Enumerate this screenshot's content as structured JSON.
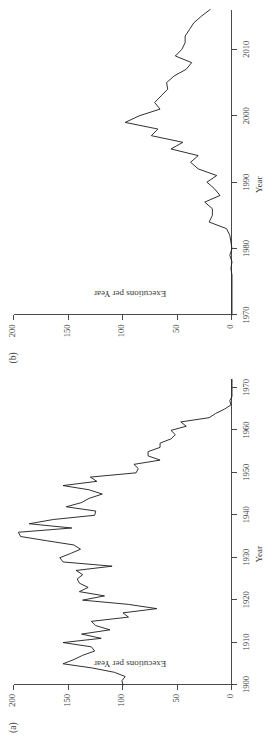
{
  "figure": {
    "orientation": "rotated-90-ccw",
    "background": "#ffffff",
    "line_color": "#1a1a1a",
    "axis_color": "#4a4a4a"
  },
  "panels": [
    {
      "label": "(a)",
      "xlabel": "Year",
      "ylabel": "Executions per Year",
      "xticks": [
        "1900",
        "1910",
        "1920",
        "1930",
        "1940",
        "1950",
        "1960",
        "1970"
      ],
      "yticks": [
        "0",
        "50",
        "100",
        "150",
        "200"
      ]
    },
    {
      "label": "(b)",
      "xlabel": "Year",
      "ylabel": "Executions per Year",
      "xticks": [
        "1970",
        "1980",
        "1990",
        "2000",
        "2010"
      ],
      "yticks": [
        "0",
        "50",
        "100",
        "150",
        "200"
      ]
    }
  ],
  "chart_data": [
    {
      "type": "line",
      "panel": "(a)",
      "title": "",
      "xlabel": "Year",
      "ylabel": "Executions per Year",
      "xlim": [
        1900,
        1972
      ],
      "ylim": [
        0,
        200
      ],
      "xticks": [
        1900,
        1910,
        1920,
        1930,
        1940,
        1950,
        1960,
        1970
      ],
      "yticks": [
        0,
        50,
        100,
        150,
        200
      ],
      "grid": false,
      "legend": "none",
      "series": [
        {
          "name": "Executions per Year",
          "x": [
            1900,
            1901,
            1902,
            1903,
            1904,
            1905,
            1906,
            1907,
            1908,
            1909,
            1910,
            1911,
            1912,
            1913,
            1914,
            1915,
            1916,
            1917,
            1918,
            1919,
            1920,
            1921,
            1922,
            1923,
            1924,
            1925,
            1926,
            1927,
            1928,
            1929,
            1930,
            1931,
            1932,
            1933,
            1934,
            1935,
            1936,
            1937,
            1938,
            1939,
            1940,
            1941,
            1942,
            1943,
            1944,
            1945,
            1946,
            1947,
            1948,
            1949,
            1950,
            1951,
            1952,
            1953,
            1954,
            1955,
            1956,
            1957,
            1958,
            1959,
            1960,
            1961,
            1962,
            1963,
            1964,
            1965,
            1966,
            1967,
            1968,
            1969,
            1970,
            1971,
            1972
          ],
          "values": [
            100,
            101,
            98,
            108,
            128,
            155,
            145,
            137,
            126,
            129,
            155,
            120,
            138,
            112,
            125,
            129,
            95,
            100,
            69,
            95,
            137,
            117,
            140,
            132,
            140,
            142,
            137,
            143,
            110,
            155,
            158,
            148,
            139,
            145,
            170,
            194,
            196,
            147,
            186,
            164,
            126,
            125,
            152,
            138,
            131,
            119,
            131,
            155,
            124,
            130,
            88,
            86,
            90,
            66,
            77,
            77,
            66,
            66,
            56,
            52,
            56,
            42,
            47,
            21,
            15,
            7,
            1,
            2,
            0,
            0,
            0,
            0,
            0
          ]
        }
      ]
    },
    {
      "type": "line",
      "panel": "(b)",
      "title": "",
      "xlabel": "Year",
      "ylabel": "Executions per Year",
      "xlim": [
        1970,
        2016
      ],
      "ylim": [
        0,
        200
      ],
      "xticks": [
        1970,
        1980,
        1990,
        2000,
        2010
      ],
      "yticks": [
        0,
        50,
        100,
        150,
        200
      ],
      "grid": false,
      "legend": "none",
      "series": [
        {
          "name": "Executions per Year",
          "x": [
            1970,
            1971,
            1972,
            1973,
            1974,
            1975,
            1976,
            1977,
            1978,
            1979,
            1980,
            1981,
            1982,
            1983,
            1984,
            1985,
            1986,
            1987,
            1988,
            1989,
            1990,
            1991,
            1992,
            1993,
            1994,
            1995,
            1996,
            1997,
            1998,
            1999,
            2000,
            2001,
            2002,
            2003,
            2004,
            2005,
            2006,
            2007,
            2008,
            2009,
            2010,
            2011,
            2012,
            2013,
            2014,
            2015,
            2016
          ],
          "values": [
            0,
            0,
            0,
            0,
            0,
            0,
            0,
            1,
            0,
            2,
            0,
            1,
            2,
            5,
            21,
            18,
            18,
            25,
            11,
            16,
            23,
            14,
            31,
            38,
            31,
            56,
            45,
            74,
            68,
            98,
            85,
            66,
            71,
            65,
            59,
            60,
            53,
            42,
            37,
            52,
            46,
            43,
            43,
            39,
            35,
            28,
            20
          ]
        }
      ]
    }
  ]
}
